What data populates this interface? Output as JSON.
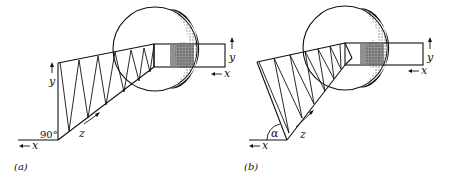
{
  "figure": {
    "panels": [
      {
        "id": "a",
        "caption": "(a)",
        "angle_label": "90°",
        "axes": {
          "x": "x",
          "y": "y",
          "z": "z"
        },
        "output_axes": {
          "x": "x",
          "y": "y"
        }
      },
      {
        "id": "b",
        "caption": "(b)",
        "angle_label": "α",
        "axes": {
          "x": "x",
          "y": "y",
          "z": "z"
        },
        "output_axes": {
          "x": "x",
          "y": "y"
        }
      }
    ]
  }
}
